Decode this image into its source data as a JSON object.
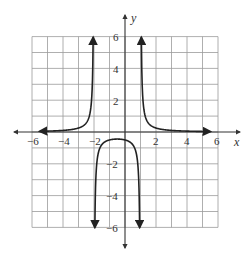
{
  "chart_data": {
    "type": "line",
    "title": "",
    "xlabel": "x",
    "ylabel": "y",
    "xlim": [
      -6,
      6
    ],
    "ylim": [
      -6,
      6
    ],
    "grid": true,
    "grid_step": 1,
    "x_ticks": [
      -6,
      -4,
      -2,
      2,
      4,
      6
    ],
    "y_ticks": [
      6,
      4,
      2,
      -2,
      -4,
      -6
    ],
    "x_tick_labels": [
      "−6",
      "−4",
      "−2",
      "2",
      "4",
      "6"
    ],
    "y_tick_labels": [
      "6",
      "4",
      "2",
      "−2",
      "−4",
      "−6"
    ],
    "vertical_asymptotes": [
      -2,
      1
    ],
    "horizontal_asymptote": 0,
    "series": [
      {
        "name": "left branch",
        "x": [
          -5.5,
          -5,
          -4,
          -3.5,
          -3,
          -2.6,
          -2.4,
          -2.3,
          -2.2,
          -2.15
        ],
        "y": [
          0.05,
          0.06,
          0.1,
          0.13,
          0.25,
          0.46,
          0.74,
          1.01,
          1.56,
          2.1
        ],
        "arrow_ends": [
          "left",
          "up"
        ]
      },
      {
        "name": "middle branch",
        "x": [
          -1.97,
          -1.9,
          -1.5,
          -1,
          -0.5,
          0,
          0.5,
          0.9,
          0.97
        ],
        "y": [
          -6,
          -3.45,
          -0.8,
          -0.5,
          -0.44,
          -0.5,
          -0.8,
          -3.45,
          -6
        ],
        "arrow_ends": [
          "down",
          "down"
        ]
      },
      {
        "name": "right branch",
        "x": [
          1.15,
          1.2,
          1.3,
          1.5,
          2,
          3,
          4,
          5,
          5.5
        ],
        "y": [
          2.1,
          1.56,
          1.01,
          0.57,
          0.25,
          0.1,
          0.06,
          0.04,
          0.03
        ],
        "arrow_ends": [
          "up",
          "right"
        ]
      }
    ]
  },
  "labels": {
    "x_axis": "x",
    "y_axis": "y",
    "xtick_neg6": "−6",
    "xtick_neg4": "−4",
    "xtick_neg2": "−2",
    "xtick_2": "2",
    "xtick_4": "4",
    "xtick_6": "6",
    "ytick_6": "6",
    "ytick_4": "4",
    "ytick_2": "2",
    "ytick_neg2": "−2",
    "ytick_neg4": "−4",
    "ytick_neg6": "−6"
  },
  "colors": {
    "grid": "#9a9a9a",
    "axis": "#333333",
    "curve": "#222222"
  }
}
